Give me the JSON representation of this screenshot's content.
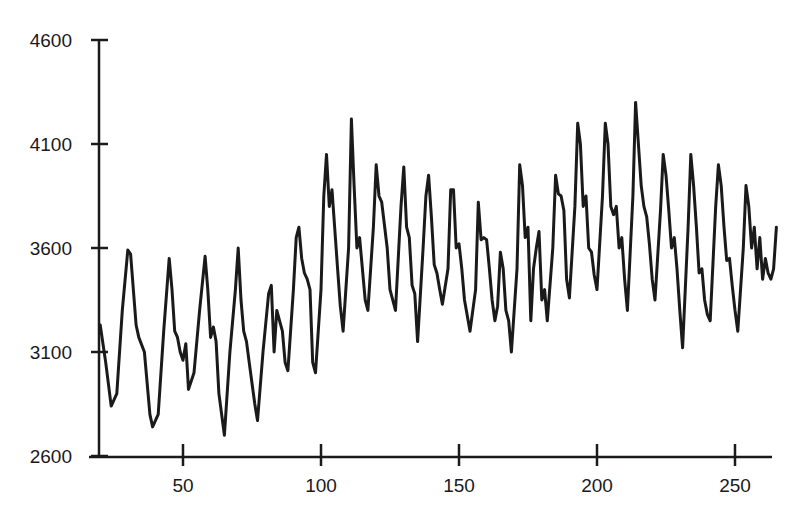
{
  "chart_data": {
    "type": "line",
    "title": "",
    "xlabel": "",
    "ylabel": "",
    "xlim": [
      20,
      265
    ],
    "ylim": [
      2600,
      4600
    ],
    "grid": false,
    "legend": null,
    "x_ticks": [
      50,
      100,
      150,
      200,
      250
    ],
    "y_ticks": [
      2600,
      3100,
      3600,
      4100,
      4600
    ],
    "x_tick_labels": [
      "50",
      "100",
      "150",
      "200",
      "250"
    ],
    "y_tick_labels": [
      "2600",
      "3100",
      "3600",
      "4100",
      "4600"
    ],
    "series": [
      {
        "name": "series-1",
        "color": "#1a1a1a",
        "points": [
          [
            20,
            3230
          ],
          [
            22,
            3050
          ],
          [
            24,
            2840
          ],
          [
            26,
            2900
          ],
          [
            28,
            3300
          ],
          [
            30,
            3590
          ],
          [
            31,
            3570
          ],
          [
            33,
            3230
          ],
          [
            34,
            3170
          ],
          [
            36,
            3100
          ],
          [
            38,
            2800
          ],
          [
            39,
            2740
          ],
          [
            41,
            2800
          ],
          [
            43,
            3200
          ],
          [
            45,
            3550
          ],
          [
            46,
            3400
          ],
          [
            47,
            3200
          ],
          [
            48,
            3170
          ],
          [
            49,
            3100
          ],
          [
            50,
            3060
          ],
          [
            51,
            3140
          ],
          [
            52,
            2920
          ],
          [
            54,
            3000
          ],
          [
            56,
            3300
          ],
          [
            58,
            3560
          ],
          [
            59,
            3400
          ],
          [
            60,
            3170
          ],
          [
            61,
            3220
          ],
          [
            62,
            3150
          ],
          [
            63,
            2900
          ],
          [
            65,
            2700
          ],
          [
            67,
            3100
          ],
          [
            69,
            3400
          ],
          [
            70,
            3600
          ],
          [
            71,
            3350
          ],
          [
            72,
            3200
          ],
          [
            73,
            3150
          ],
          [
            74,
            3050
          ],
          [
            75,
            2950
          ],
          [
            76,
            2850
          ],
          [
            77,
            2770
          ],
          [
            79,
            3100
          ],
          [
            81,
            3380
          ],
          [
            82,
            3420
          ],
          [
            83,
            3100
          ],
          [
            84,
            3300
          ],
          [
            85,
            3250
          ],
          [
            86,
            3200
          ],
          [
            87,
            3050
          ],
          [
            88,
            3010
          ],
          [
            90,
            3400
          ],
          [
            91,
            3650
          ],
          [
            92,
            3700
          ],
          [
            93,
            3550
          ],
          [
            94,
            3480
          ],
          [
            95,
            3450
          ],
          [
            96,
            3400
          ],
          [
            97,
            3050
          ],
          [
            98,
            3000
          ],
          [
            100,
            3400
          ],
          [
            101,
            3850
          ],
          [
            102,
            4050
          ],
          [
            103,
            3800
          ],
          [
            104,
            3880
          ],
          [
            106,
            3500
          ],
          [
            107,
            3320
          ],
          [
            108,
            3200
          ],
          [
            110,
            3600
          ],
          [
            111,
            4220
          ],
          [
            112,
            3900
          ],
          [
            113,
            3600
          ],
          [
            114,
            3650
          ],
          [
            116,
            3350
          ],
          [
            117,
            3300
          ],
          [
            119,
            3700
          ],
          [
            120,
            4000
          ],
          [
            121,
            3850
          ],
          [
            122,
            3820
          ],
          [
            124,
            3600
          ],
          [
            125,
            3400
          ],
          [
            127,
            3300
          ],
          [
            129,
            3800
          ],
          [
            130,
            3990
          ],
          [
            131,
            3700
          ],
          [
            132,
            3650
          ],
          [
            133,
            3420
          ],
          [
            134,
            3380
          ],
          [
            135,
            3150
          ],
          [
            137,
            3600
          ],
          [
            138,
            3850
          ],
          [
            139,
            3950
          ],
          [
            140,
            3750
          ],
          [
            141,
            3520
          ],
          [
            142,
            3480
          ],
          [
            143,
            3400
          ],
          [
            144,
            3330
          ],
          [
            146,
            3500
          ],
          [
            147,
            3880
          ],
          [
            148,
            3880
          ],
          [
            149,
            3600
          ],
          [
            150,
            3620
          ],
          [
            151,
            3500
          ],
          [
            152,
            3350
          ],
          [
            154,
            3200
          ],
          [
            156,
            3400
          ],
          [
            157,
            3820
          ],
          [
            158,
            3640
          ],
          [
            159,
            3650
          ],
          [
            160,
            3640
          ],
          [
            161,
            3500
          ],
          [
            162,
            3350
          ],
          [
            163,
            3250
          ],
          [
            164,
            3320
          ],
          [
            165,
            3580
          ],
          [
            166,
            3500
          ],
          [
            167,
            3300
          ],
          [
            168,
            3250
          ],
          [
            169,
            3100
          ],
          [
            171,
            3500
          ],
          [
            172,
            4000
          ],
          [
            173,
            3900
          ],
          [
            174,
            3650
          ],
          [
            175,
            3700
          ],
          [
            176,
            3250
          ],
          [
            177,
            3500
          ],
          [
            178,
            3600
          ],
          [
            179,
            3680
          ],
          [
            180,
            3350
          ],
          [
            181,
            3400
          ],
          [
            182,
            3250
          ],
          [
            184,
            3600
          ],
          [
            185,
            3950
          ],
          [
            186,
            3860
          ],
          [
            187,
            3850
          ],
          [
            188,
            3780
          ],
          [
            189,
            3450
          ],
          [
            190,
            3360
          ],
          [
            192,
            3800
          ],
          [
            193,
            4200
          ],
          [
            194,
            4100
          ],
          [
            195,
            3800
          ],
          [
            196,
            3850
          ],
          [
            197,
            3600
          ],
          [
            198,
            3580
          ],
          [
            199,
            3470
          ],
          [
            200,
            3400
          ],
          [
            202,
            3850
          ],
          [
            203,
            4200
          ],
          [
            204,
            4100
          ],
          [
            205,
            3800
          ],
          [
            206,
            3760
          ],
          [
            207,
            3800
          ],
          [
            208,
            3600
          ],
          [
            209,
            3650
          ],
          [
            210,
            3450
          ],
          [
            211,
            3300
          ],
          [
            213,
            3850
          ],
          [
            214,
            4300
          ],
          [
            215,
            4100
          ],
          [
            216,
            3900
          ],
          [
            217,
            3800
          ],
          [
            218,
            3750
          ],
          [
            219,
            3620
          ],
          [
            220,
            3450
          ],
          [
            221,
            3350
          ],
          [
            223,
            3780
          ],
          [
            224,
            4050
          ],
          [
            225,
            3950
          ],
          [
            226,
            3780
          ],
          [
            227,
            3600
          ],
          [
            228,
            3650
          ],
          [
            229,
            3500
          ],
          [
            230,
            3300
          ],
          [
            231,
            3120
          ],
          [
            233,
            3700
          ],
          [
            234,
            4050
          ],
          [
            235,
            3900
          ],
          [
            236,
            3700
          ],
          [
            237,
            3480
          ],
          [
            238,
            3500
          ],
          [
            239,
            3350
          ],
          [
            240,
            3280
          ],
          [
            241,
            3250
          ],
          [
            243,
            3800
          ],
          [
            244,
            4000
          ],
          [
            245,
            3900
          ],
          [
            246,
            3700
          ],
          [
            247,
            3540
          ],
          [
            248,
            3550
          ],
          [
            249,
            3420
          ],
          [
            250,
            3300
          ],
          [
            251,
            3200
          ],
          [
            253,
            3600
          ],
          [
            254,
            3900
          ],
          [
            255,
            3800
          ],
          [
            256,
            3600
          ],
          [
            257,
            3700
          ],
          [
            258,
            3500
          ],
          [
            259,
            3650
          ],
          [
            260,
            3450
          ],
          [
            261,
            3550
          ],
          [
            262,
            3480
          ],
          [
            263,
            3450
          ],
          [
            264,
            3500
          ],
          [
            265,
            3700
          ]
        ]
      }
    ]
  }
}
